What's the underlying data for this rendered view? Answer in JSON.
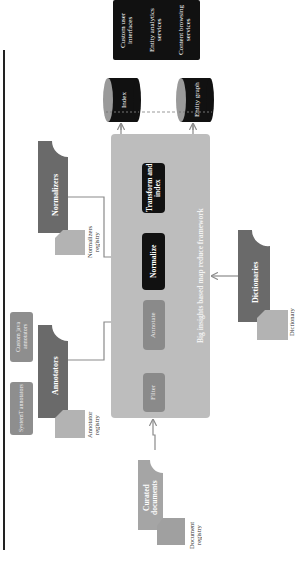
{
  "services": {
    "lines": [
      "Content browsing services",
      "Entity analytics services",
      "Custom user interfaces"
    ]
  },
  "stores": {
    "index": "Index",
    "entity_graph": "Entity graph"
  },
  "framework": {
    "title": "Big insights based map reduce framework",
    "steps": {
      "transform": "Transform and index",
      "normalize": "Normalize",
      "annotate": "Annotate",
      "filter": "Filter"
    }
  },
  "sources": {
    "normalizers": "Normalizers",
    "normalizers_registry": "Normalizers registry",
    "annotators": "Annotators",
    "annotator_registry": "Annotator registry",
    "custom_java": "Custom java annotators",
    "systemt": "SystemT annotators",
    "dictionaries": "Dictionaries",
    "dictionary_registry": "Dictionary",
    "curated": "Curated documents",
    "document_registry": "Document registry"
  },
  "colors": {
    "black": "#111111",
    "framework": "#bdbdbd",
    "step_grey": "#8a8a8a",
    "source_dark": "#6a6a6a",
    "source_light": "#a5a5a5"
  }
}
